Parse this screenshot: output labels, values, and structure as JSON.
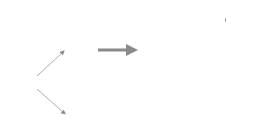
{
  "diagram": {
    "nodes": {
      "training": "TRAINING",
      "codebook": "Codebook",
      "model": "Model",
      "model_function": "f(x)",
      "feature_extraction": "Feature Extraction",
      "bag_of_visual_words": "Bag of Visual Words",
      "classification": "Classification",
      "predicted_label": "Predicted Label",
      "query_image": "Query Image"
    },
    "codebook_symbols": [
      "circle",
      "triangle",
      "ellipsis",
      "square"
    ],
    "codebook_ellipsis": "· · ·",
    "edges": [
      {
        "from": "training",
        "to": "codebook"
      },
      {
        "from": "training",
        "to": "model"
      },
      {
        "from": "query_image",
        "to": "feature_extraction"
      },
      {
        "from": "feature_extraction",
        "to": "bag_of_visual_words"
      },
      {
        "from": "codebook",
        "to": "bag_of_visual_words"
      },
      {
        "from": "bag_of_visual_words",
        "to": "classification"
      },
      {
        "from": "model",
        "to": "classification"
      },
      {
        "from": "classification",
        "to": "predicted_label"
      }
    ],
    "colors": {
      "box_fill": "#e4e4e4",
      "arrow": "#8a8a8a",
      "text": "#333333"
    }
  }
}
